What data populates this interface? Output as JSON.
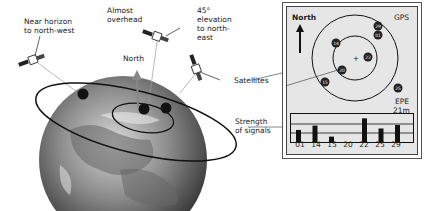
{
  "labels": {
    "near_horizon": "Near horizon\nto north-west",
    "near_horizon_1": "Near horizon",
    "near_horizon_2": "to north-west",
    "overhead_1": "Almost",
    "overhead_2": "overhead",
    "elev_1": "45°",
    "elev_2": "elevation",
    "elev_3": "to north-",
    "elev_4": "east",
    "north": "North",
    "satellites": "Satellites",
    "strength_1": "Strength",
    "strength_2": "of signals"
  },
  "panel": {
    "north": "North",
    "gps": "GPS",
    "epe_label": "EPE",
    "epe_value": "21m",
    "satellites": [
      {
        "id": "29",
        "x": 91,
        "y": 19
      },
      {
        "id": "01",
        "x": 91,
        "y": 28
      },
      {
        "id": "14",
        "x": 49,
        "y": 36
      },
      {
        "id": "22",
        "x": 81,
        "y": 50
      },
      {
        "id": "20",
        "x": 55,
        "y": 63
      },
      {
        "id": "15",
        "x": 38,
        "y": 75
      },
      {
        "id": "25",
        "x": 111,
        "y": 81
      }
    ],
    "signal_ids": [
      "01",
      "14",
      "15",
      "20",
      "22",
      "25",
      "29"
    ],
    "signal_strength": [
      45,
      60,
      22,
      0,
      85,
      50,
      62
    ]
  },
  "colors": {
    "panel_bg": "#e6e6e6",
    "ink": "#111111",
    "earth_dark": "#555555",
    "earth_light": "#bcbcbc"
  }
}
